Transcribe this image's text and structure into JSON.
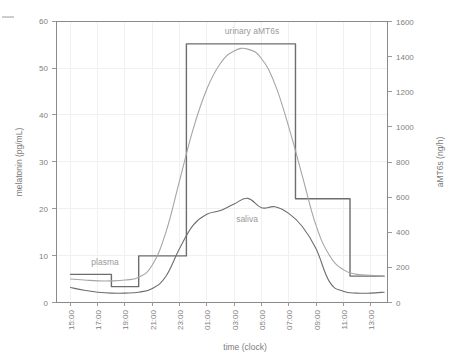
{
  "chart_data": {
    "type": "line",
    "title": "",
    "xlabel": "time (clock)",
    "ylabel": "melatonin (pg/mL)",
    "y2label": "aMT6s (ng/h)",
    "x": [
      "15:00",
      "17:00",
      "19:00",
      "21:00",
      "23:00",
      "01:00",
      "03:00",
      "05:00",
      "07:00",
      "09:00",
      "11:00",
      "13:00"
    ],
    "xticklabels": [
      "15:00",
      "17:00",
      "19:00",
      "21:00",
      "23:00",
      "01:00",
      "03:00",
      "05:00",
      "07:00",
      "09:00",
      "11:00",
      "13:00"
    ],
    "yticklabels": [
      "0",
      "10",
      "20",
      "30",
      "40",
      "50",
      "60"
    ],
    "yticks": [
      0,
      10,
      20,
      30,
      40,
      50,
      60
    ],
    "ylim": [
      0,
      60
    ],
    "y2ticklabels": [
      "0",
      "200",
      "400",
      "600",
      "800",
      "1000",
      "1200",
      "1400",
      "1600"
    ],
    "y2ticks": [
      0,
      200,
      400,
      600,
      800,
      1000,
      1200,
      1400,
      1600
    ],
    "y2lim": [
      0,
      1600
    ],
    "grid": true,
    "legend_position": "inline-annotations",
    "series": [
      {
        "name": "plasma",
        "axis": "left",
        "units": "pg/mL",
        "color": "#9a9a9a",
        "label_text": "plasma",
        "x": [
          "15:00",
          "16:00",
          "17:00",
          "18:00",
          "19:00",
          "20:00",
          "21:00",
          "22:00",
          "23:00",
          "00:00",
          "01:00",
          "02:00",
          "03:00",
          "04:00",
          "05:00",
          "06:00",
          "07:00",
          "08:00",
          "09:00",
          "10:00",
          "11:00",
          "12:00",
          "13:00",
          "14:00"
        ],
        "values": [
          5.0,
          4.8,
          4.6,
          4.6,
          4.8,
          5.4,
          8.0,
          15.0,
          26.0,
          37.0,
          45.5,
          51.0,
          53.6,
          54.0,
          52.0,
          46.5,
          37.5,
          27.0,
          16.5,
          10.0,
          7.0,
          6.0,
          5.8,
          5.6
        ]
      },
      {
        "name": "saliva",
        "axis": "left",
        "units": "pg/mL",
        "color": "#6d6d6d",
        "label_text": "saliva",
        "x": [
          "15:00",
          "16:00",
          "17:00",
          "18:00",
          "19:00",
          "20:00",
          "21:00",
          "22:00",
          "23:00",
          "00:00",
          "01:00",
          "02:00",
          "03:00",
          "04:00",
          "05:00",
          "06:00",
          "07:00",
          "08:00",
          "09:00",
          "10:00",
          "11:00",
          "12:00",
          "13:00",
          "14:00"
        ],
        "values": [
          3.2,
          2.6,
          2.2,
          2.0,
          2.0,
          2.2,
          3.0,
          5.6,
          11.5,
          16.5,
          18.8,
          19.6,
          21.0,
          22.2,
          20.2,
          20.4,
          19.0,
          16.2,
          11.5,
          4.4,
          2.4,
          2.0,
          2.0,
          2.2
        ]
      },
      {
        "name": "urinary aMT6s",
        "axis": "right",
        "units": "ng/h",
        "color": "#6d6d6d",
        "label_text": "urinary aMT6s",
        "style": "step",
        "step_intervals": [
          {
            "from": "15:00",
            "to": "18:00",
            "value": 160
          },
          {
            "from": "18:00",
            "to": "20:00",
            "value": 90
          },
          {
            "from": "20:00",
            "to": "21:00",
            "value": 265
          },
          {
            "from": "21:00",
            "to": "23:30",
            "value": 265
          },
          {
            "from": "23:30",
            "to": "07:30",
            "value": 1470
          },
          {
            "from": "07:30",
            "to": "11:30",
            "value": 590
          },
          {
            "from": "11:30",
            "to": "14:00",
            "value": 150
          }
        ]
      }
    ],
    "annotations": [
      {
        "text": "urinary aMT6s",
        "x": "04:00",
        "y_axis": "right",
        "y": 1610
      },
      {
        "text": "plasma",
        "x": "17:30",
        "y_axis": "left",
        "y": 8.0
      },
      {
        "text": "saliva",
        "x": "04:00",
        "y_axis": "left",
        "y": 19.5
      }
    ]
  }
}
